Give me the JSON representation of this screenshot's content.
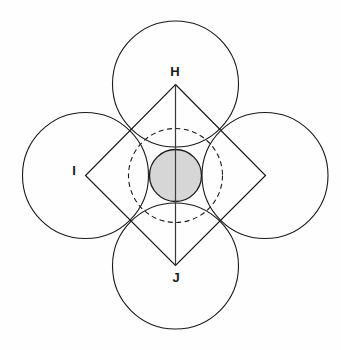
{
  "figure": {
    "canvas": {
      "width": 341,
      "height": 350,
      "background": "#fefefe"
    },
    "center": {
      "x": 175.5,
      "y": 175.5
    },
    "labels": [
      {
        "id": "H",
        "text": "H",
        "x": 175,
        "y": 73,
        "role": "top-vertex-label"
      },
      {
        "id": "I",
        "text": "I",
        "x": 74,
        "y": 172,
        "role": "left-vertex-label"
      },
      {
        "id": "J",
        "text": "J",
        "x": 176,
        "y": 279,
        "role": "bottom-vertex-label"
      }
    ],
    "outer_circles": [
      {
        "id": "top",
        "cx": 175.5,
        "cy": 84.0,
        "r": 63.0,
        "stroke": "#1a1a1a"
      },
      {
        "id": "left",
        "cx": 85.5,
        "cy": 175.5,
        "r": 63.0,
        "stroke": "#1a1a1a"
      },
      {
        "id": "right",
        "cx": 265.0,
        "cy": 175.5,
        "r": 63.0,
        "stroke": "#1a1a1a"
      },
      {
        "id": "bottom",
        "cx": 175.5,
        "cy": 266.0,
        "r": 63.0,
        "stroke": "#1a1a1a"
      }
    ],
    "diamond": {
      "points": "175.5,84.5 265.5,175.5 175.5,265.5 85.5,175.5",
      "stroke": "#1a1a1a",
      "vertices": [
        {
          "x": 175.5,
          "y": 84.5
        },
        {
          "x": 265.5,
          "y": 175.5
        },
        {
          "x": 175.5,
          "y": 265.5
        },
        {
          "x": 85.5,
          "y": 175.5
        }
      ]
    },
    "dashed_circle": {
      "cx": 175.5,
      "cy": 175.5,
      "r": 47.0,
      "stroke": "#1a1a1a",
      "dash": "5 3.5"
    },
    "inner_circle": {
      "cx": 175.5,
      "cy": 175.5,
      "r": 26.0,
      "fill": "#d6d6d6",
      "stroke": "#1a1a1a"
    },
    "axis_line": {
      "x1": 175.5,
      "y1": 84.5,
      "x2": 175.5,
      "y2": 265.5,
      "stroke": "#3a3a3a"
    }
  }
}
